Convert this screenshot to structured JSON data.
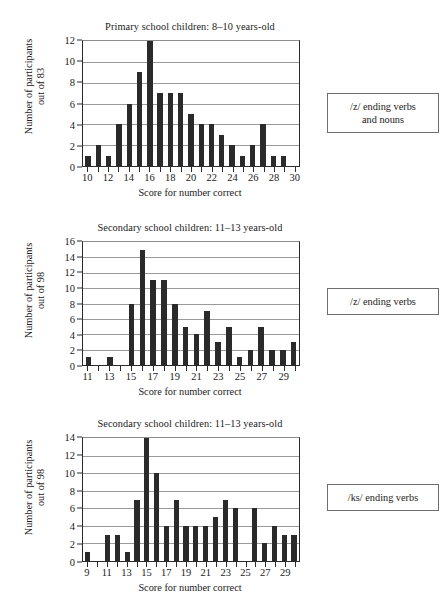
{
  "figure": {
    "panels": [
      {
        "id": "panel-primary-z-verbs-nouns",
        "title": "Primary school children: 8–10 years-old",
        "ylabel_line1": "Number of participants",
        "ylabel_line2": "out of 83",
        "xlabel": "Score for number correct",
        "legend_line1": "/z/ ending verbs",
        "legend_line2": "and nouns",
        "yticks": [
          0,
          2,
          4,
          6,
          8,
          10,
          12
        ],
        "xtick_labels": [
          10,
          12,
          14,
          16,
          18,
          20,
          22,
          24,
          26,
          28,
          30
        ]
      },
      {
        "id": "panel-secondary-z-verbs",
        "title": "Secondary school children: 11–13 years-old",
        "ylabel_line1": "Number of participants",
        "ylabel_line2": "out of 98",
        "xlabel": "Score for number correct",
        "legend_line1": "/z/ ending verbs",
        "legend_line2": "",
        "yticks": [
          0,
          2,
          4,
          6,
          8,
          10,
          12,
          14,
          16
        ],
        "xtick_labels": [
          11,
          13,
          15,
          17,
          19,
          21,
          23,
          25,
          27,
          29
        ]
      },
      {
        "id": "panel-secondary-ks-verbs",
        "title": "Secondary school children: 11–13 years-old",
        "ylabel_line1": "Number of participants",
        "ylabel_line2": "out of 98",
        "xlabel": "Score for number correct",
        "legend_line1": "/ks/ ending verbs",
        "legend_line2": "",
        "yticks": [
          0,
          2,
          4,
          6,
          8,
          10,
          12,
          14
        ],
        "xtick_labels": [
          9,
          11,
          13,
          15,
          17,
          19,
          21,
          23,
          25,
          27,
          29
        ]
      }
    ],
    "colors": {
      "bar": "#2a2a2a",
      "axis": "#2b2b2b",
      "grid": "#9a9a9a",
      "legend_border": "#6e6e6e",
      "background": "#ffffff"
    }
  },
  "chart_data": [
    {
      "type": "bar",
      "title": "Primary school children: 8–10 years-old",
      "xlabel": "Score for number correct",
      "ylabel": "Number of participants out of 83",
      "legend": "/z/ ending verbs and nouns",
      "categories": [
        10,
        11,
        12,
        13,
        14,
        15,
        16,
        17,
        18,
        19,
        20,
        21,
        22,
        23,
        24,
        25,
        26,
        27,
        28,
        29,
        30
      ],
      "values": [
        1,
        2,
        1,
        4,
        6,
        9,
        12,
        7,
        7,
        7,
        5,
        4,
        4,
        3,
        2,
        1,
        2,
        4,
        1,
        1,
        0
      ],
      "xlim": [
        9.5,
        30.5
      ],
      "ylim": [
        0,
        12
      ],
      "ytick_step": 2,
      "xtick_labels_shown": [
        10,
        12,
        14,
        16,
        18,
        20,
        22,
        24,
        26,
        28,
        30
      ],
      "grid": "horizontal",
      "legend_position": "right"
    },
    {
      "type": "bar",
      "title": "Secondary school children: 11–13 years-old",
      "xlabel": "Score for number correct",
      "ylabel": "Number of participants out of 98",
      "legend": "/z/ ending verbs",
      "categories": [
        11,
        12,
        13,
        14,
        15,
        16,
        17,
        18,
        19,
        20,
        21,
        22,
        23,
        24,
        25,
        26,
        27,
        28,
        29,
        30
      ],
      "values": [
        1,
        0,
        1,
        0,
        8,
        15,
        11,
        11,
        8,
        5,
        4,
        7,
        3,
        5,
        1,
        2,
        5,
        2,
        2,
        3
      ],
      "xlim": [
        10.5,
        30.5
      ],
      "ylim": [
        0,
        16
      ],
      "ytick_step": 2,
      "xtick_labels_shown": [
        11,
        13,
        15,
        17,
        19,
        21,
        23,
        25,
        27,
        29
      ],
      "grid": "horizontal",
      "legend_position": "right"
    },
    {
      "type": "bar",
      "title": "Secondary school children: 11–13 years-old",
      "xlabel": "Score for number correct",
      "ylabel": "Number of participants out of 98",
      "legend": "/ks/ ending verbs",
      "categories": [
        9,
        10,
        11,
        12,
        13,
        14,
        15,
        16,
        17,
        18,
        19,
        20,
        21,
        22,
        23,
        24,
        25,
        26,
        27,
        28,
        29,
        30
      ],
      "values": [
        1,
        0,
        3,
        3,
        1,
        7,
        14,
        10,
        4,
        7,
        4,
        4,
        4,
        5,
        7,
        6,
        0,
        6,
        2,
        4,
        3,
        3
      ],
      "xlim": [
        8.5,
        30.5
      ],
      "ylim": [
        0,
        14
      ],
      "ytick_step": 2,
      "xtick_labels_shown": [
        9,
        11,
        13,
        15,
        17,
        19,
        21,
        23,
        25,
        27,
        29
      ],
      "grid": "horizontal",
      "legend_position": "right"
    }
  ]
}
